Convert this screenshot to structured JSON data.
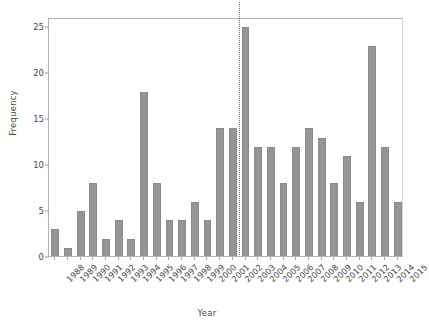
{
  "chart_data": {
    "type": "bar",
    "title": "",
    "xlabel": "Year",
    "ylabel": "Frequency",
    "categories": [
      "1988",
      "1989",
      "1990",
      "1991",
      "1992",
      "1993",
      "1994",
      "1995",
      "1996",
      "1997",
      "1998",
      "1999",
      "2000",
      "2001",
      "2002",
      "2003",
      "2004",
      "2005",
      "2006",
      "2007",
      "2008",
      "2009",
      "2010",
      "2011",
      "2012",
      "2013",
      "2014",
      "2015"
    ],
    "values": [
      3,
      1,
      5,
      8,
      2,
      4,
      2,
      18,
      8,
      4,
      4,
      6,
      4,
      14,
      14,
      25,
      12,
      12,
      8,
      12,
      14,
      13,
      8,
      11,
      6,
      23,
      12,
      6
    ],
    "ylim": [
      0,
      26
    ],
    "yticks": [
      0,
      5,
      10,
      15,
      20,
      25
    ],
    "ytick_labels": [
      "0",
      "5",
      "10",
      "15",
      "20",
      "25"
    ],
    "grid": false,
    "legend": null,
    "bar_color": "#969696",
    "annotations": [
      {
        "type": "vertical-dotted-line",
        "name": "year-divider",
        "between": [
          "2002",
          "2003"
        ],
        "color": "#707070",
        "style": "dotted"
      }
    ]
  }
}
